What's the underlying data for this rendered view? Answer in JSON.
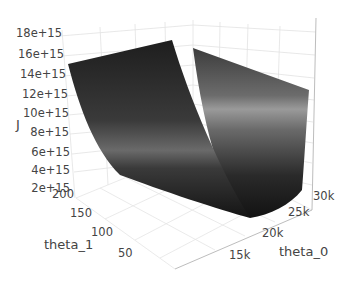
{
  "chart_data": {
    "type": "surface",
    "title": "",
    "xlabel": "theta_0",
    "ylabel": "theta_1",
    "zlabel": "J",
    "x_ticks": [
      "15k",
      "20k",
      "25k",
      "30k"
    ],
    "y_ticks": [
      "50",
      "100",
      "150",
      "200"
    ],
    "z_ticks": [
      "2e+15",
      "4e+15",
      "6e+15",
      "8e+15",
      "10e+15",
      "12e+15",
      "14e+15",
      "16e+15",
      "18e+15"
    ],
    "xlim": [
      12000,
      32000
    ],
    "ylim": [
      20,
      210
    ],
    "zlim": [
      0,
      19000000000000000
    ],
    "colorscale": "greys",
    "surface_samples": [
      {
        "theta_0": 12000,
        "theta_1": 210,
        "J": 15500000000000000
      },
      {
        "theta_0": 22000,
        "theta_1": 210,
        "J": 16800000000000000
      },
      {
        "theta_0": 22000,
        "theta_1": 20,
        "J": 16000000000000000
      },
      {
        "theta_0": 32000,
        "theta_1": 20,
        "J": 13500000000000000
      },
      {
        "theta_0": 20000,
        "theta_1": 110,
        "J": 500000000000000
      }
    ],
    "grid": true,
    "legend": false
  },
  "axes": {
    "z": {
      "label": "J",
      "ticks": [
        {
          "text": "18e+15",
          "x": 2,
          "y": 34
        },
        {
          "text": "16e+15",
          "x": 4,
          "y": 55
        },
        {
          "text": "14e+15",
          "x": 6,
          "y": 75
        },
        {
          "text": "12e+15",
          "x": 8,
          "y": 95
        },
        {
          "text": "10e+15",
          "x": 9,
          "y": 114
        },
        {
          "text": "8e+15",
          "x": 9,
          "y": 133
        },
        {
          "text": "6e+15",
          "x": 10,
          "y": 153
        },
        {
          "text": "4e+15",
          "x": 10,
          "y": 171
        },
        {
          "text": "2e+15",
          "x": 10,
          "y": 189
        }
      ]
    },
    "y": {
      "label": "theta_1",
      "ticks": [
        {
          "text": "200",
          "x": 52,
          "y": 195
        },
        {
          "text": "150",
          "x": 70,
          "y": 214
        },
        {
          "text": "100",
          "x": 91,
          "y": 233
        },
        {
          "text": "50",
          "x": 118,
          "y": 254
        }
      ]
    },
    "x": {
      "label": "theta_0",
      "ticks": [
        {
          "text": "15k",
          "x": 229,
          "y": 256
        },
        {
          "text": "20k",
          "x": 262,
          "y": 234
        },
        {
          "text": "25k",
          "x": 288,
          "y": 213
        },
        {
          "text": "30k",
          "x": 313,
          "y": 197
        }
      ]
    }
  },
  "colors": {
    "grid": "#e2e2e2",
    "axis_line": "#bdbdbd",
    "surface_dark": "#1a1a1a",
    "surface_light": "#8a8a8a"
  }
}
